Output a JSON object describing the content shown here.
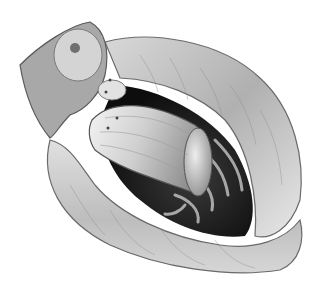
{
  "image": {
    "description": "Grayscale anatomical illustration of an opened bowel segment with cylindrical mass",
    "width": 319,
    "height": 297,
    "colors": {
      "background": "#ffffff",
      "wall_light": "#e6e6e6",
      "wall_mid": "#b8b8b8",
      "wall_dark": "#7a7a7a",
      "lumen": "#1a1a1a",
      "mass_light": "#f2f2f2",
      "mass_dark": "#9a9a9a",
      "outline": "#5a5a5a"
    }
  }
}
